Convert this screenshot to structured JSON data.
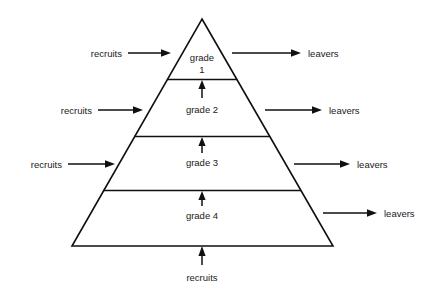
{
  "diagram": {
    "type": "pyramid-flow-diagram",
    "stroke_color": "#101010",
    "fill_color": "#ffffff",
    "text_color": "#1a1a1a",
    "grades": [
      {
        "id": "grade-1",
        "label_line1": "grade",
        "label_line2": "1",
        "label_full": "grade 1"
      },
      {
        "id": "grade-2",
        "label_line1": "grade 2",
        "label_line2": "",
        "label_full": "grade 2"
      },
      {
        "id": "grade-3",
        "label_line1": "grade 3",
        "label_line2": "",
        "label_full": "grade 3"
      },
      {
        "id": "grade-4",
        "label_line1": "grade 4",
        "label_line2": "",
        "label_full": "grade 4"
      }
    ],
    "inflows": [
      {
        "id": "recruits-grade-1",
        "label": "recruits",
        "direction": "right",
        "target_grade": "grade 1"
      },
      {
        "id": "recruits-grade-2",
        "label": "recruits",
        "direction": "right",
        "target_grade": "grade 2"
      },
      {
        "id": "recruits-grade-3",
        "label": "recruits",
        "direction": "right",
        "target_grade": "grade 3"
      },
      {
        "id": "recruits-grade-4",
        "label": "recruits",
        "direction": "up",
        "target_grade": "grade 4"
      }
    ],
    "outflows": [
      {
        "id": "leavers-grade-1",
        "label": "leavers",
        "direction": "right",
        "source_grade": "grade 1"
      },
      {
        "id": "leavers-grade-2",
        "label": "leavers",
        "direction": "right",
        "source_grade": "grade 2"
      },
      {
        "id": "leavers-grade-3",
        "label": "leavers",
        "direction": "right",
        "source_grade": "grade 3"
      },
      {
        "id": "leavers-grade-4",
        "label": "leavers",
        "direction": "right",
        "source_grade": "grade 4"
      }
    ],
    "promotions": [
      {
        "id": "promotion-2-to-1",
        "from": "grade 2",
        "to": "grade 1",
        "direction": "up"
      },
      {
        "id": "promotion-3-to-2",
        "from": "grade 3",
        "to": "grade 2",
        "direction": "up"
      },
      {
        "id": "promotion-4-to-3",
        "from": "grade 4",
        "to": "grade 3",
        "direction": "up"
      }
    ]
  }
}
